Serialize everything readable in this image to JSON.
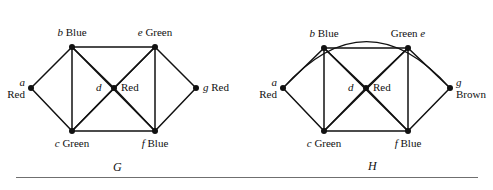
{
  "figure": {
    "width": 493,
    "height": 190,
    "background": "#ffffff",
    "stroke_color": "#111111",
    "vertex_color": "#111111",
    "rule_color": "#6f6f6f"
  },
  "graphs": [
    {
      "name": "G",
      "caption": "G",
      "caption_pos": {
        "x": 113,
        "y": 160
      },
      "has_arc": false,
      "vertices": [
        {
          "id": "a",
          "color_label": "Red",
          "x": 31,
          "y": 88,
          "label_layout": "stacked-left",
          "label_x": 31,
          "label_y": 89
        },
        {
          "id": "b",
          "color_label": "Blue",
          "x": 72,
          "y": 47,
          "label_layout": "above",
          "label_x": 72,
          "label_y": 27
        },
        {
          "id": "c",
          "color_label": "Green",
          "x": 72,
          "y": 131,
          "label_layout": "below",
          "label_x": 72,
          "label_y": 138
        },
        {
          "id": "d",
          "color_label": "Red",
          "x": 114,
          "y": 88,
          "label_layout": "split",
          "label_x": 114,
          "label_y": 82
        },
        {
          "id": "e",
          "color_label": "Green",
          "x": 155,
          "y": 47,
          "label_layout": "above",
          "label_x": 155,
          "label_y": 27
        },
        {
          "id": "f",
          "color_label": "Blue",
          "x": 155,
          "y": 131,
          "label_layout": "below",
          "label_x": 155,
          "label_y": 138
        },
        {
          "id": "g",
          "color_label": "Red",
          "x": 196,
          "y": 88,
          "label_layout": "right",
          "label_x": 203,
          "label_y": 82
        }
      ],
      "edges": [
        [
          "a",
          "b"
        ],
        [
          "a",
          "c"
        ],
        [
          "b",
          "c"
        ],
        [
          "b",
          "e"
        ],
        [
          "b",
          "d"
        ],
        [
          "b",
          "f"
        ],
        [
          "c",
          "d"
        ],
        [
          "c",
          "e"
        ],
        [
          "c",
          "f"
        ],
        [
          "d",
          "e"
        ],
        [
          "d",
          "f"
        ],
        [
          "e",
          "f"
        ],
        [
          "e",
          "g"
        ],
        [
          "f",
          "g"
        ]
      ]
    },
    {
      "name": "H",
      "caption": "H",
      "caption_pos": {
        "x": 368,
        "y": 159
      },
      "has_arc": true,
      "arc": {
        "from": "a",
        "to": "g",
        "peak_y": 12
      },
      "vertices": [
        {
          "id": "a",
          "color_label": "Red",
          "x": 283,
          "y": 88,
          "label_layout": "stacked-left",
          "label_x": 283,
          "label_y": 89
        },
        {
          "id": "b",
          "color_label": "Blue",
          "x": 324,
          "y": 48,
          "label_layout": "above",
          "label_x": 324,
          "label_y": 28
        },
        {
          "id": "c",
          "color_label": "Green",
          "x": 324,
          "y": 131,
          "label_layout": "below",
          "label_x": 324,
          "label_y": 138
        },
        {
          "id": "d",
          "color_label": "Red",
          "x": 366,
          "y": 88,
          "label_layout": "split",
          "label_x": 366,
          "label_y": 82
        },
        {
          "id": "e",
          "color_label": "Green",
          "x": 408,
          "y": 48,
          "label_layout": "above-rev",
          "label_x": 408,
          "label_y": 28
        },
        {
          "id": "f",
          "color_label": "Blue",
          "x": 408,
          "y": 131,
          "label_layout": "below",
          "label_x": 408,
          "label_y": 138
        },
        {
          "id": "g",
          "color_label": "Brown",
          "x": 450,
          "y": 88,
          "label_layout": "stacked-right",
          "label_x": 450,
          "label_y": 89
        }
      ],
      "edges": [
        [
          "a",
          "b"
        ],
        [
          "a",
          "c"
        ],
        [
          "a",
          "g"
        ],
        [
          "b",
          "c"
        ],
        [
          "b",
          "e"
        ],
        [
          "b",
          "d"
        ],
        [
          "b",
          "f"
        ],
        [
          "c",
          "d"
        ],
        [
          "c",
          "e"
        ],
        [
          "c",
          "f"
        ],
        [
          "d",
          "e"
        ],
        [
          "d",
          "f"
        ],
        [
          "e",
          "f"
        ],
        [
          "e",
          "g"
        ],
        [
          "f",
          "g"
        ]
      ]
    }
  ],
  "vertex_labels": {
    "G": {
      "a": {
        "id": "a",
        "color": "Red"
      },
      "b": {
        "id": "b",
        "color": "Blue"
      },
      "c": {
        "id": "c",
        "color": "Green"
      },
      "d": {
        "id": "d",
        "color": "Red"
      },
      "e": {
        "id": "e",
        "color": "Green"
      },
      "f": {
        "id": "f",
        "color": "Blue"
      },
      "g": {
        "id": "g",
        "color": "Red"
      }
    },
    "H": {
      "a": {
        "id": "a",
        "color": "Red"
      },
      "b": {
        "id": "b",
        "color": "Blue"
      },
      "c": {
        "id": "c",
        "color": "Green"
      },
      "d": {
        "id": "d",
        "color": "Red"
      },
      "e": {
        "id": "e",
        "color": "Green"
      },
      "f": {
        "id": "f",
        "color": "Blue"
      },
      "g": {
        "id": "g",
        "color": "Brown"
      }
    }
  }
}
